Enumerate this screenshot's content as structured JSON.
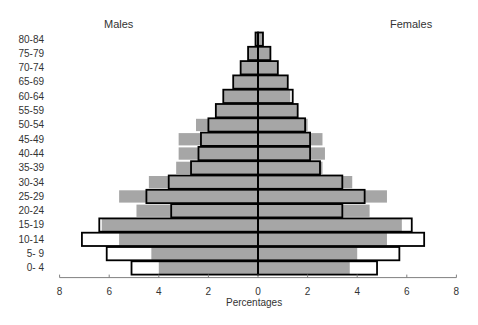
{
  "chart_data": {
    "type": "bar",
    "subtype": "population-pyramid",
    "title": "",
    "left_title": "Males",
    "right_title": "Females",
    "xlabel": "Percentages",
    "ylabel": "",
    "xlim": [
      -8,
      8
    ],
    "xticks": [
      8,
      6,
      4,
      2,
      0,
      2,
      4,
      6,
      8
    ],
    "grid": false,
    "categories": [
      "80-84",
      "75-79",
      "70-74",
      "65-69",
      "60-64",
      "55-59",
      "50-54",
      "45-49",
      "40-44",
      "35-39",
      "30-34",
      "25-29",
      "20-24",
      "15-19",
      "10-14",
      "5- 9",
      "0- 4"
    ],
    "series": [
      {
        "name": "Males (outlined)",
        "side": "left",
        "style": "outline",
        "values": [
          0.1,
          0.4,
          0.7,
          1.0,
          1.4,
          1.7,
          2.0,
          2.3,
          2.4,
          2.7,
          3.6,
          4.5,
          3.5,
          6.4,
          7.1,
          6.1,
          5.1
        ]
      },
      {
        "name": "Males (gray)",
        "side": "left",
        "style": "gray",
        "values": [
          0.1,
          0.4,
          0.7,
          1.0,
          1.4,
          1.7,
          2.5,
          3.2,
          3.2,
          3.3,
          4.4,
          5.6,
          4.9,
          6.3,
          5.6,
          4.3,
          4.0
        ]
      },
      {
        "name": "Females (outlined)",
        "side": "right",
        "style": "outline",
        "values": [
          0.2,
          0.5,
          0.8,
          1.2,
          1.4,
          1.6,
          1.9,
          2.1,
          2.1,
          2.5,
          3.4,
          4.3,
          3.4,
          6.2,
          6.7,
          5.7,
          4.8
        ]
      },
      {
        "name": "Females (gray)",
        "side": "right",
        "style": "gray",
        "values": [
          0.2,
          0.5,
          0.8,
          1.2,
          1.3,
          1.6,
          2.0,
          2.6,
          2.7,
          2.6,
          3.8,
          5.2,
          4.5,
          5.8,
          5.2,
          4.0,
          3.7
        ]
      }
    ],
    "colors": {
      "gray": "#a6a6a6",
      "outline": "#000000",
      "axis": "#808080"
    }
  }
}
